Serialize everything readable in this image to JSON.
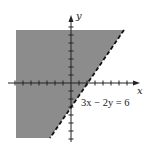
{
  "figure": {
    "type": "linear-inequality-graph",
    "inequality_boundary": "3x − 2y = 6",
    "boundary_style": "dashed",
    "shaded_side": "left/above the line (3x − 2y < 6)",
    "x_axis_label": "x",
    "y_axis_label": "y",
    "colors": {
      "shade": "#8c8c8c",
      "axes": "#222222",
      "line": "#111111",
      "background": "#ffffff"
    },
    "grid_units": {
      "x_range": [
        -7,
        8
      ],
      "y_range": [
        -7,
        7
      ],
      "tick_spacing": 1
    },
    "intercepts": {
      "x_intercept": [
        2,
        0
      ],
      "y_intercept": [
        0,
        -3
      ]
    }
  },
  "labels": {
    "x": "x",
    "y": "y",
    "equation": "3x − 2y = 6"
  }
}
